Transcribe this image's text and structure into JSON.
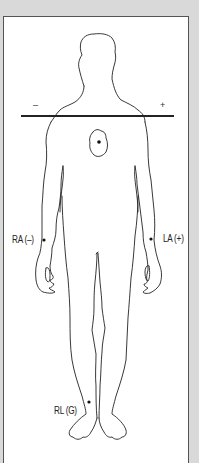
{
  "diagram": {
    "axis_line": {
      "negative_label": "–",
      "positive_label": "+"
    },
    "heart": {
      "name": "heart-outline"
    },
    "electrodes": [
      {
        "id": "RA",
        "label": "RA (–)",
        "position": "right wrist"
      },
      {
        "id": "LA",
        "label": "LA (+)",
        "position": "left wrist"
      },
      {
        "id": "RL",
        "label": "RL (G)",
        "position": "right ankle"
      }
    ]
  },
  "colors": {
    "background": "#d9d9d9",
    "panel": "#ffffff",
    "frame_border": "#555555",
    "outline": "#222222",
    "axis_line": "#222222"
  }
}
